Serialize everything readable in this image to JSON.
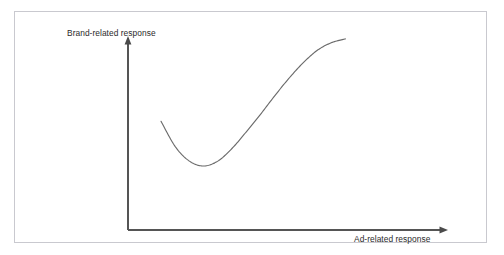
{
  "clipped_caption": {
    "text": ""
  },
  "figure": {
    "background_color": "#ffffff",
    "border_color": "#c9c9cf"
  },
  "chart_data": {
    "type": "line",
    "title": "",
    "xlabel": "Ad-related response",
    "ylabel": "Brand-related response",
    "grid": false,
    "legend": null,
    "axes": {
      "x_arrow": true,
      "y_arrow": true,
      "x_tick_labels": [],
      "y_tick_labels": [],
      "xlim": [
        0,
        1
      ],
      "ylim": [
        0,
        1
      ],
      "line_color": "#555555"
    },
    "series": [
      {
        "name": "Brand-related vs Ad-related response",
        "shape": "u-shaped-curve",
        "color": "#6b6b6b",
        "x": [
          0.105,
          0.15,
          0.195,
          0.24,
          0.285,
          0.33,
          0.375,
          0.42,
          0.465,
          0.51,
          0.555,
          0.6,
          0.645,
          0.69
        ],
        "y": [
          0.56,
          0.43,
          0.355,
          0.33,
          0.355,
          0.42,
          0.505,
          0.595,
          0.69,
          0.78,
          0.86,
          0.925,
          0.965,
          0.985
        ]
      }
    ]
  }
}
